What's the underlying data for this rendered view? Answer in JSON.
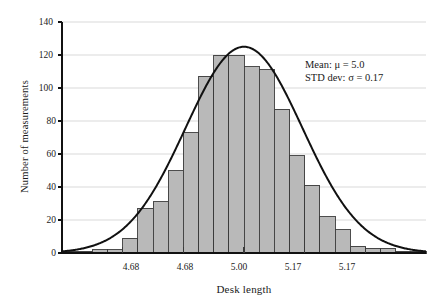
{
  "chart_data": {
    "type": "bar",
    "title": "",
    "subtitle": "",
    "xlabel": "Desk length",
    "ylabel": "Number of measurements",
    "ylim": [
      0,
      140
    ],
    "ytick_values": [
      0,
      20,
      40,
      60,
      80,
      100,
      120,
      140
    ],
    "ytick_labels": [
      "0",
      "20",
      "40",
      "60",
      "80",
      "100",
      "120",
      "140"
    ],
    "xtick_labels": [
      "4.68",
      "4.68",
      "5.00",
      "5.17",
      "5.17"
    ],
    "grid": "horizontal",
    "legend": "none",
    "bin_count": 24,
    "categories": [
      "b1",
      "b2",
      "b3",
      "b4",
      "b5",
      "b6",
      "b7",
      "b8",
      "b9",
      "b10",
      "b11",
      "b12",
      "b13",
      "b14",
      "b15",
      "b16",
      "b17",
      "b18",
      "b19",
      "b20",
      "b21",
      "b22",
      "b23",
      "b24"
    ],
    "values": [
      1,
      1,
      2,
      2,
      9,
      27,
      31,
      50,
      73,
      107,
      120,
      120,
      113,
      111,
      87,
      59,
      41,
      22,
      14,
      4,
      3,
      3,
      1,
      1
    ],
    "bar_fill_color": "#b9b9b9",
    "bar_edge_color": "#3a3a3a",
    "curve_color": "#111111",
    "curve_label": "normal distribution fit",
    "curve_peak_value": 125,
    "curve_mean_bin_index": 11.5,
    "curve_sigma_bins": 3.85,
    "annotations": [
      {
        "text": "Mean: μ = 5.0"
      },
      {
        "text": "STD dev: σ = 0.17"
      }
    ]
  },
  "figure": {
    "background_color": "#ffffff",
    "axis_color": "#111111",
    "grid_color": "#cfcfcf"
  }
}
